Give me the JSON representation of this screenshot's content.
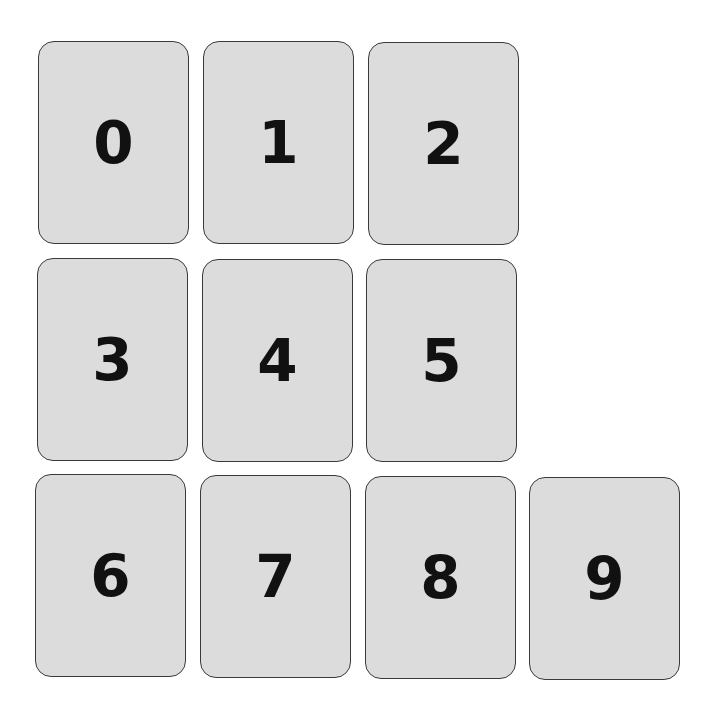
{
  "cards": [
    {
      "label": "0"
    },
    {
      "label": "1"
    },
    {
      "label": "2"
    },
    {
      "label": "3"
    },
    {
      "label": "4"
    },
    {
      "label": "5"
    },
    {
      "label": "6"
    },
    {
      "label": "7"
    },
    {
      "label": "8"
    },
    {
      "label": "9"
    }
  ]
}
